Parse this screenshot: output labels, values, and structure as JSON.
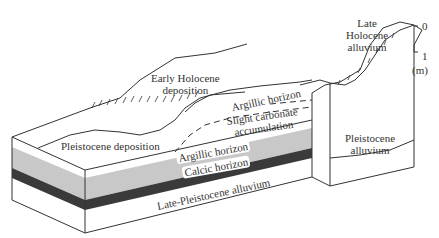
{
  "diagram": {
    "type": "geologic block diagram",
    "labels": {
      "early_holocene": "Early Holocene deposition",
      "early_holocene_l1": "Early Holocene",
      "early_holocene_l2": "deposition",
      "late_holocene_l1": "Late",
      "late_holocene_l2": "Holocene",
      "late_holocene_l3": "alluvium",
      "argillic_upper": "Argillic horizon",
      "slight_carbonate_l1": "Slight carbonate",
      "slight_carbonate_l2": "accumulation",
      "pleistocene_deposition": "Pleistocene deposition",
      "argillic_lower": "Argillic horizon",
      "calcic": "Calcic horizon",
      "late_pleistocene": "Late-Pleistocene alluvium",
      "pleistocene_alluvium_l1": "Pleistocene",
      "pleistocene_alluvium_l2": "alluvium"
    },
    "scale_bar": {
      "top": "0",
      "bottom": "1",
      "unit": "(m)"
    },
    "colors": {
      "argillic_layer": "#c8c8c8",
      "calcic_layer": "#3a3a3a",
      "line": "#333333"
    }
  }
}
